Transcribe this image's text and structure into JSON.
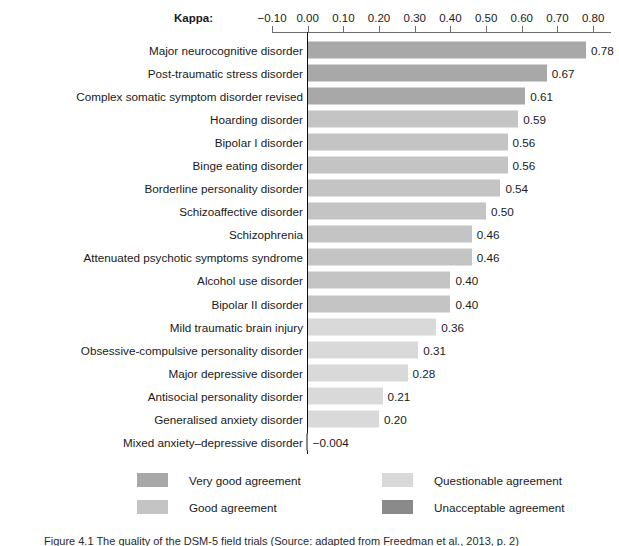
{
  "chart_data": {
    "type": "bar",
    "orientation": "horizontal",
    "title": "",
    "xlabel": "Kappa",
    "ylabel": "",
    "xlim": [
      -0.1,
      0.85
    ],
    "grid": false,
    "axis_prefix_label": "Kappa:",
    "tick_labels": [
      "−0.10",
      "0.00",
      "0.10",
      "0.20",
      "0.30",
      "0.40",
      "0.50",
      "0.60",
      "0.70",
      "0.80"
    ],
    "tick_values": [
      -0.1,
      0.0,
      0.1,
      0.2,
      0.3,
      0.4,
      0.5,
      0.6,
      0.7,
      0.8
    ],
    "zero_reference_line": 0.0,
    "categories": [
      "Major neurocognitive disorder",
      "Post-traumatic stress disorder",
      "Complex somatic symptom disorder revised",
      "Hoarding disorder",
      "Bipolar I disorder",
      "Binge eating disorder",
      "Borderline personality disorder",
      "Schizoaffective disorder",
      "Schizophrenia",
      "Attenuated psychotic symptoms syndrome",
      "Alcohol use disorder",
      "Bipolar II disorder",
      "Mild traumatic brain injury",
      "Obsessive-compulsive personality disorder",
      "Major depressive disorder",
      "Antisocial personality disorder",
      "Generalised anxiety disorder",
      "Mixed anxiety–depressive disorder"
    ],
    "values": [
      0.78,
      0.67,
      0.61,
      0.59,
      0.56,
      0.56,
      0.54,
      0.5,
      0.46,
      0.46,
      0.4,
      0.4,
      0.36,
      0.31,
      0.28,
      0.21,
      0.2,
      -0.004
    ],
    "value_labels": [
      "0.78",
      "0.67",
      "0.61",
      "0.59",
      "0.56",
      "0.56",
      "0.54",
      "0.50",
      "0.46",
      "0.46",
      "0.40",
      "0.40",
      "0.36",
      "0.31",
      "0.28",
      "0.21",
      "0.20",
      "−0.004"
    ],
    "bar_categories": [
      "very-good",
      "very-good",
      "very-good",
      "good",
      "good",
      "good",
      "good",
      "good",
      "good",
      "good",
      "good",
      "good",
      "questionable",
      "questionable",
      "questionable",
      "questionable",
      "questionable",
      "unacceptable"
    ],
    "legend_position": "bottom"
  },
  "legend": {
    "items": [
      {
        "label": "Very good agreement",
        "key": "very-good",
        "color": "#a8a8a8"
      },
      {
        "label": "Good agreement",
        "key": "good",
        "color": "#c4c4c4"
      },
      {
        "label": "Questionable agreement",
        "key": "questionable",
        "color": "#d9d9d9"
      },
      {
        "label": "Unacceptable agreement",
        "key": "unacceptable",
        "color": "#8a8a8a"
      }
    ]
  },
  "caption": {
    "text": "Figure 4.1 The quality of the DSM-5 field trials (Source: adapted from Freedman et al., 2013, p. 2)"
  },
  "colors": {
    "axis": "#6e6e6e",
    "zero_line": "#111111",
    "text": "#1a1a1a",
    "background": "#ffffff"
  }
}
